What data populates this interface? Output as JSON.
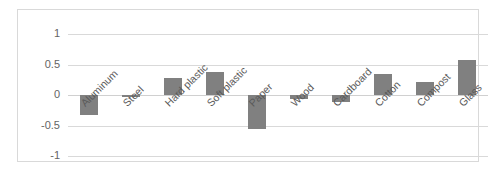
{
  "chart_data": {
    "type": "bar",
    "title": "",
    "subtitle": "",
    "xlabel": "",
    "ylabel": "",
    "ylim": [
      -1,
      1
    ],
    "yticks": [
      1,
      0.5,
      0,
      -0.5,
      -1
    ],
    "ytick_labels": [
      "1",
      "0.5",
      "0",
      "-0.5",
      "-1"
    ],
    "grid": true,
    "legend": false,
    "legend_position": "none",
    "bar_color": "#808080",
    "gridline_color": "#d9d9d9",
    "border_color": "#d9d9d9",
    "axis_label_color": "#646464",
    "categories": [
      "Aluminum",
      "Steel",
      "Hard plastic",
      "Soft plastic",
      "Paper",
      "Wood",
      "Cardboard",
      "Cotton",
      "Compost",
      "Glass"
    ],
    "values": [
      -0.32,
      -0.02,
      0.28,
      0.38,
      -0.56,
      -0.06,
      -0.12,
      0.35,
      0.22,
      0.57
    ]
  }
}
